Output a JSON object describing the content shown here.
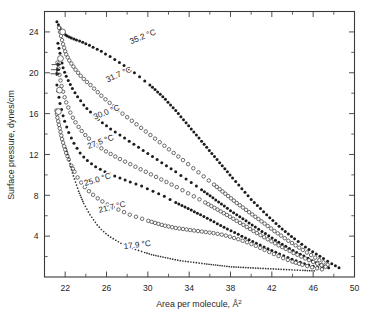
{
  "figure": {
    "name": "surface-pressure-area-isotherms",
    "background": "#ffffff",
    "ink": "#1c1c1c"
  },
  "chart_data": {
    "type": "scatter",
    "title": "",
    "subtitle": "",
    "xlabel": "Area per molecule, Å",
    "xlabel_sup": "2",
    "ylabel": "Surface pressure, dynes/cm",
    "xlim": [
      20,
      50
    ],
    "ylim": [
      0,
      26
    ],
    "grid": false,
    "legend_position": "inline-annotations",
    "x_ticks_major": [
      22,
      26,
      30,
      34,
      38,
      42,
      46,
      50
    ],
    "x_ticks_major_labels": [
      "22",
      "26",
      "30",
      "34",
      "38",
      "42",
      "46",
      "50"
    ],
    "x_ticks_minor": [
      20,
      24,
      28,
      32,
      36,
      40,
      44,
      48
    ],
    "y_ticks_major": [
      4,
      8,
      12,
      16,
      20,
      24
    ],
    "y_ticks_major_labels": [
      "4",
      "8",
      "12",
      "16",
      "20",
      "24"
    ],
    "y_ticks_minor": [
      2,
      6,
      10,
      14,
      18,
      22,
      26
    ],
    "series": [
      {
        "name": "35.2 °C",
        "label": "35.2 °C",
        "marker": "filled-circle",
        "label_x": 29.6,
        "label_y": 23.3,
        "label_rotate": -22,
        "x": [
          21.2,
          21.35,
          21.5,
          21.6,
          21.75,
          21.9,
          22.05,
          22.2,
          22.4,
          22.6,
          22.85,
          23.1,
          23.4,
          23.7,
          24.0,
          24.35,
          24.7,
          25.1,
          25.5,
          25.9,
          26.35,
          26.8,
          27.25,
          27.7,
          28.2,
          28.7,
          29.2,
          29.7,
          30.2,
          30.7,
          31.2,
          31.7,
          32.2,
          32.7,
          33.2,
          33.7,
          34.2,
          34.7,
          35.2,
          35.7,
          36.2,
          36.7,
          37.2,
          37.7,
          38.2,
          38.8,
          39.4,
          40.0,
          40.6,
          41.2,
          41.8,
          42.4,
          43.0,
          43.6,
          44.2,
          44.9,
          45.6,
          46.3,
          47.0,
          47.8,
          48.5
        ],
        "y": [
          25.0,
          24.7,
          24.4,
          24.2,
          24.0,
          23.85,
          23.7,
          23.6,
          23.5,
          23.4,
          23.3,
          23.2,
          23.1,
          23.0,
          22.85,
          22.7,
          22.5,
          22.3,
          22.1,
          21.85,
          21.6,
          21.3,
          21.0,
          20.7,
          20.35,
          20.0,
          19.6,
          19.2,
          18.8,
          18.35,
          17.9,
          17.4,
          16.85,
          16.3,
          15.7,
          15.1,
          14.5,
          13.9,
          13.3,
          12.7,
          12.1,
          11.5,
          10.9,
          10.3,
          9.7,
          9.0,
          8.3,
          7.6,
          7.0,
          6.4,
          5.8,
          5.25,
          4.7,
          4.2,
          3.75,
          3.2,
          2.7,
          2.25,
          1.8,
          1.3,
          0.9
        ]
      },
      {
        "name": "31.7 °C",
        "label": "31.7 °C",
        "marker": "open-circle",
        "label_x": 27.3,
        "label_y": 19.6,
        "label_rotate": -24,
        "x": [
          21.4,
          21.5,
          21.6,
          21.7,
          21.8,
          21.9,
          22.0,
          22.1,
          22.25,
          22.4,
          22.6,
          22.8,
          23.0,
          23.25,
          23.5,
          23.8,
          24.1,
          24.45,
          24.8,
          25.15,
          25.5,
          25.9,
          26.3,
          26.7,
          27.1,
          27.55,
          28.0,
          28.45,
          28.9,
          29.35,
          29.8,
          30.25,
          30.7,
          31.15,
          31.6,
          32.05,
          32.5,
          32.95,
          33.4,
          33.9,
          34.4,
          34.9,
          35.4,
          35.9,
          36.4,
          36.95,
          37.5,
          38.05,
          38.6,
          39.2,
          39.8,
          40.4,
          41.0,
          41.6,
          42.25,
          42.9,
          43.6,
          44.3,
          45.0,
          45.8,
          46.6,
          47.4
        ],
        "y": [
          24.4,
          24.0,
          23.6,
          23.2,
          22.8,
          22.45,
          22.1,
          21.8,
          21.5,
          21.2,
          20.9,
          20.6,
          20.3,
          20.0,
          19.7,
          19.4,
          19.1,
          18.8,
          18.45,
          18.1,
          17.75,
          17.4,
          17.05,
          16.7,
          16.35,
          16.0,
          15.65,
          15.3,
          14.95,
          14.6,
          14.25,
          13.9,
          13.55,
          13.2,
          12.85,
          12.5,
          12.15,
          11.8,
          11.45,
          11.05,
          10.65,
          10.25,
          9.85,
          9.45,
          9.05,
          8.6,
          8.15,
          7.7,
          7.25,
          6.8,
          6.35,
          5.9,
          5.45,
          5.0,
          4.5,
          4.05,
          3.55,
          3.1,
          2.65,
          2.15,
          1.65,
          1.2
        ]
      },
      {
        "name": "30.0 °C",
        "label": "30.0 °C",
        "marker": "filled-circle",
        "label_x": 26.1,
        "label_y": 15.9,
        "label_rotate": -22,
        "x": [
          21.3,
          21.4,
          21.5,
          21.6,
          21.7,
          21.8,
          21.95,
          22.1,
          22.3,
          22.5,
          22.7,
          22.95,
          23.2,
          23.5,
          23.8,
          24.1,
          24.45,
          24.8,
          25.2,
          25.6,
          26.0,
          26.4,
          26.85,
          27.3,
          27.75,
          28.2,
          28.65,
          29.1,
          29.55,
          30.0,
          30.45,
          30.9,
          31.35,
          31.8,
          32.25,
          32.7,
          33.2,
          33.7,
          34.2,
          34.7,
          35.2,
          35.75,
          36.3,
          36.85,
          37.4,
          38.0,
          38.6,
          39.2,
          39.8,
          40.4,
          41.05,
          41.7,
          42.35,
          43.0,
          43.7,
          44.4,
          45.1,
          45.9,
          46.7,
          47.5
        ],
        "y": [
          22.9,
          22.4,
          21.9,
          21.4,
          20.95,
          20.5,
          20.05,
          19.65,
          19.25,
          18.85,
          18.45,
          18.05,
          17.65,
          17.25,
          16.85,
          16.5,
          16.15,
          15.8,
          15.45,
          15.1,
          14.8,
          14.5,
          14.2,
          13.9,
          13.6,
          13.3,
          13.0,
          12.7,
          12.4,
          12.1,
          11.8,
          11.5,
          11.2,
          10.9,
          10.6,
          10.3,
          9.95,
          9.6,
          9.25,
          8.9,
          8.55,
          8.15,
          7.75,
          7.35,
          6.95,
          6.5,
          6.1,
          5.7,
          5.3,
          4.9,
          4.45,
          4.05,
          3.6,
          3.2,
          2.8,
          2.4,
          2.05,
          1.6,
          1.2,
          0.9
        ]
      },
      {
        "name": "27.5 °C",
        "label": "27.5 °C",
        "marker": "open-circle",
        "label_x": 25.5,
        "label_y": 13.0,
        "label_rotate": -20,
        "x": [
          21.25,
          21.35,
          21.45,
          21.55,
          21.65,
          21.8,
          21.95,
          22.1,
          22.3,
          22.5,
          22.75,
          23.0,
          23.3,
          23.6,
          23.95,
          24.3,
          24.7,
          25.1,
          25.5,
          25.95,
          26.4,
          26.85,
          27.3,
          27.8,
          28.3,
          28.8,
          29.3,
          29.8,
          30.3,
          30.8,
          31.3,
          31.8,
          32.3,
          32.8,
          33.35,
          33.9,
          34.45,
          35.0,
          35.55,
          36.15,
          36.75,
          37.35,
          37.95,
          38.6,
          39.25,
          39.9,
          40.55,
          41.25,
          41.95,
          42.65,
          43.35,
          44.1,
          44.85,
          45.6,
          46.4,
          47.2
        ],
        "y": [
          21.0,
          20.4,
          19.8,
          19.25,
          18.7,
          18.15,
          17.6,
          17.1,
          16.6,
          16.1,
          15.6,
          15.15,
          14.7,
          14.3,
          13.9,
          13.55,
          13.2,
          12.9,
          12.6,
          12.3,
          12.05,
          11.8,
          11.55,
          11.3,
          11.05,
          10.8,
          10.55,
          10.3,
          10.05,
          9.8,
          9.55,
          9.3,
          9.05,
          8.8,
          8.5,
          8.2,
          7.9,
          7.6,
          7.3,
          6.95,
          6.6,
          6.25,
          5.9,
          5.5,
          5.1,
          4.7,
          4.3,
          3.9,
          3.5,
          3.1,
          2.75,
          2.35,
          2.0,
          1.65,
          1.3,
          1.0
        ]
      },
      {
        "name": "25.0 °C",
        "label": "25.0 °C",
        "marker": "filled-circle",
        "label_x": 25.2,
        "label_y": 9.3,
        "label_rotate": -17,
        "x": [
          21.2,
          21.3,
          21.4,
          21.5,
          21.65,
          21.8,
          21.95,
          22.15,
          22.35,
          22.6,
          22.85,
          23.15,
          23.45,
          23.8,
          24.15,
          24.55,
          24.95,
          25.4,
          25.85,
          26.3,
          26.8,
          27.3,
          27.8,
          28.3,
          28.85,
          29.4,
          29.95,
          30.5,
          31.05,
          31.6,
          32.15,
          32.7,
          33.3,
          33.9,
          34.5,
          35.1,
          35.75,
          36.4,
          37.05,
          37.7,
          38.4,
          39.1,
          39.8,
          40.5,
          41.25,
          42.0,
          42.75,
          43.55,
          44.35,
          45.15,
          46.0,
          46.85
        ],
        "y": [
          18.8,
          18.2,
          17.6,
          17.0,
          16.4,
          15.8,
          15.25,
          14.7,
          14.15,
          13.6,
          13.1,
          12.6,
          12.15,
          11.75,
          11.4,
          11.1,
          10.8,
          10.55,
          10.3,
          10.1,
          9.9,
          9.7,
          9.5,
          9.3,
          9.1,
          8.9,
          8.65,
          8.4,
          8.15,
          7.9,
          7.6,
          7.3,
          7.0,
          6.7,
          6.4,
          6.1,
          5.75,
          5.4,
          5.05,
          4.7,
          4.35,
          4.0,
          3.65,
          3.3,
          2.95,
          2.6,
          2.25,
          1.9,
          1.6,
          1.3,
          1.05,
          0.85
        ]
      },
      {
        "name": "21.7 °C",
        "label": "21.7 °C",
        "marker": "open-circle",
        "label_x": 26.6,
        "label_y": 6.6,
        "label_rotate": -13,
        "x": [
          21.15,
          21.25,
          21.4,
          21.55,
          21.7,
          21.9,
          22.1,
          22.35,
          22.6,
          22.9,
          23.2,
          23.55,
          23.9,
          24.3,
          24.7,
          25.15,
          25.6,
          26.1,
          26.6,
          27.15,
          27.7,
          28.25,
          28.85,
          29.45,
          30.05,
          30.7,
          31.35,
          32.0,
          32.7,
          33.4,
          34.1,
          34.85,
          35.6,
          36.35,
          37.15,
          37.95,
          38.75,
          39.6,
          40.45,
          41.3,
          42.2,
          43.1,
          44.0,
          44.95,
          45.9,
          46.85
        ],
        "y": [
          16.3,
          15.6,
          14.9,
          14.2,
          13.5,
          12.8,
          12.15,
          11.5,
          10.9,
          10.3,
          9.75,
          9.25,
          8.8,
          8.4,
          8.05,
          7.7,
          7.4,
          7.1,
          6.85,
          6.6,
          6.35,
          6.1,
          5.9,
          5.7,
          5.5,
          5.3,
          5.1,
          4.95,
          4.8,
          4.7,
          4.6,
          4.5,
          4.4,
          4.3,
          4.15,
          3.95,
          3.7,
          3.4,
          3.05,
          2.65,
          2.25,
          1.85,
          1.5,
          1.2,
          0.95,
          0.75
        ]
      },
      {
        "name": "17.9 °C",
        "label": "17.9 °C",
        "marker": "small-dot",
        "label_x": 29.0,
        "label_y": 2.9,
        "label_rotate": -7,
        "x": [
          22.1,
          22.25,
          22.4,
          22.55,
          22.7,
          22.9,
          23.1,
          23.3,
          23.55,
          23.8,
          24.1,
          24.4,
          24.75,
          25.1,
          25.5,
          25.95,
          26.4,
          26.9,
          27.4,
          27.95,
          28.5,
          29.1,
          29.7,
          30.35,
          31.0,
          31.7,
          32.4,
          33.15,
          33.9,
          34.7,
          35.5,
          36.35,
          37.2,
          38.1,
          39.0,
          39.95,
          40.9,
          41.9,
          42.9,
          43.95,
          45.0,
          46.1
        ],
        "y": [
          12.6,
          12.0,
          11.4,
          10.8,
          10.2,
          9.6,
          9.0,
          8.4,
          7.8,
          7.2,
          6.65,
          6.1,
          5.6,
          5.1,
          4.65,
          4.25,
          3.9,
          3.6,
          3.3,
          3.05,
          2.8,
          2.6,
          2.4,
          2.2,
          2.05,
          1.9,
          1.75,
          1.6,
          1.5,
          1.4,
          1.3,
          1.2,
          1.1,
          1.0,
          0.95,
          0.9,
          0.85,
          0.8,
          0.75,
          0.7,
          0.65,
          0.6
        ]
      }
    ],
    "annotations": {
      "collapse_arrows": [
        {
          "x": 21.55,
          "y": 20.8
        },
        {
          "x": 21.5,
          "y": 20.3
        },
        {
          "x": 21.45,
          "y": 19.9
        }
      ],
      "marker_open_highlights": [
        {
          "x": 21.95,
          "y": 26.1
        },
        {
          "x": 21.75,
          "y": 24.0
        },
        {
          "x": 21.55,
          "y": 21.4
        },
        {
          "x": 21.45,
          "y": 18.3
        },
        {
          "x": 21.35,
          "y": 16.2
        }
      ]
    }
  }
}
